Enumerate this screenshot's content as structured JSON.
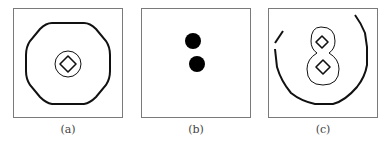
{
  "figure": {
    "panels": [
      {
        "id": "a",
        "caption": "(a)",
        "description": "rounded-square contour with two nested concentric contours at center"
      },
      {
        "id": "b",
        "caption": "(b)",
        "description": "two filled black dots stacked vertically"
      },
      {
        "id": "c",
        "caption": "(c)",
        "description": "open outer contour with figure-eight shaped nested contours"
      }
    ],
    "colors": {
      "stroke": "#111111",
      "border": "#7a7a7a",
      "caption": "#444444"
    }
  }
}
